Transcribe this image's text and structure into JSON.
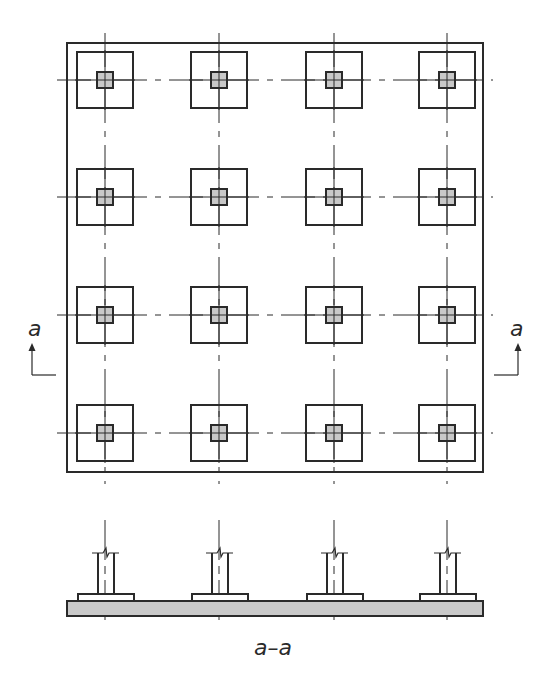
{
  "diagram": {
    "plan": {
      "outline": {
        "x": 67,
        "y": 43,
        "w": 416,
        "h": 429
      },
      "grid_x": [
        105,
        219,
        334,
        447
      ],
      "grid_y": [
        80,
        197,
        315,
        433
      ],
      "pad_size": 56,
      "column_size": 16,
      "rows": 4,
      "cols": 4
    },
    "section_marks": {
      "left": {
        "label": "a",
        "x": 35,
        "y": 365
      },
      "right": {
        "label": "a",
        "x": 510,
        "y": 365
      }
    },
    "section": {
      "label": "a–a",
      "slab": {
        "x": 67,
        "y": 601,
        "w": 416,
        "h": 15
      },
      "pad_width": 56,
      "pad_height": 7,
      "column_width": 16,
      "column_top": 553
    },
    "colors": {
      "line": "#2a2a2a",
      "column_fill": "#c8c8c8",
      "slab_fill": "#c9c9c9",
      "background": "#ffffff"
    }
  }
}
